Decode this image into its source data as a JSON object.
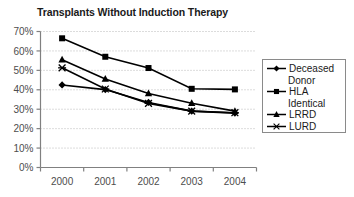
{
  "chart_data": {
    "type": "line",
    "title": "Transplants Without Induction Therapy",
    "xlabel": "",
    "ylabel": "",
    "categories": [
      "2000",
      "2001",
      "2002",
      "2003",
      "2004"
    ],
    "ylim": [
      0,
      70
    ],
    "ytick_labels": [
      "0%",
      "10%",
      "20%",
      "30%",
      "40%",
      "50%",
      "60%",
      "70%"
    ],
    "ytick_values": [
      0,
      10,
      20,
      30,
      40,
      50,
      60,
      70
    ],
    "grid": "horizontal-dotted",
    "legend_position": "right",
    "series": [
      {
        "name": "Deceased Donor",
        "marker": "diamond",
        "color": "#000000",
        "values": [
          42.5,
          40.1,
          33.5,
          29.0,
          28.0
        ]
      },
      {
        "name": "HLA Identical",
        "marker": "square",
        "color": "#000000",
        "values": [
          66.5,
          57.0,
          51.2,
          40.5,
          40.2
        ]
      },
      {
        "name": "LRRD",
        "marker": "triangle",
        "color": "#000000",
        "values": [
          55.5,
          45.6,
          38.1,
          33.1,
          29.0
        ]
      },
      {
        "name": "LURD",
        "marker": "cross",
        "color": "#000000",
        "values": [
          51.3,
          40.4,
          33.0,
          29.0,
          28.2
        ]
      }
    ]
  },
  "legend": {
    "items": [
      {
        "line1": "Deceased",
        "line2": "Donor",
        "marker": "diamond"
      },
      {
        "line1": "HLA",
        "line2": "Identical",
        "marker": "square"
      },
      {
        "line1": "LRRD",
        "line2": "",
        "marker": "triangle"
      },
      {
        "line1": "LURD",
        "line2": "",
        "marker": "cross"
      }
    ]
  },
  "axes": {
    "y_labels": [
      "70%",
      "60%",
      "50%",
      "40%",
      "30%",
      "20%",
      "10%",
      "0%"
    ],
    "x_labels": [
      "2000",
      "2001",
      "2002",
      "2003",
      "2004"
    ]
  },
  "colors": {
    "line": "#000000",
    "grid": "#b8b8b8",
    "axis": "#808080",
    "text": "#1a1a1a",
    "tick_text": "#4d4d4d",
    "legend_border": "#8a8a8a",
    "background": "#ffffff"
  }
}
